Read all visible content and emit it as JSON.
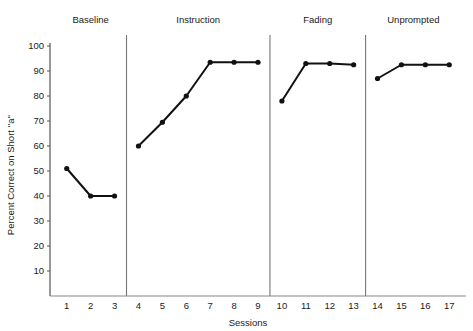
{
  "chart_data": {
    "type": "line",
    "title": "",
    "xlabel": "Sessions",
    "ylabel": "Percent Correct on Short ''a''",
    "xlim": [
      0.3,
      17.7
    ],
    "ylim": [
      0,
      100
    ],
    "yticks": [
      10,
      20,
      30,
      40,
      50,
      60,
      70,
      80,
      90,
      100
    ],
    "xticks": [
      1,
      2,
      3,
      4,
      5,
      6,
      7,
      8,
      9,
      10,
      11,
      12,
      13,
      14,
      15,
      16,
      17
    ],
    "grid": false,
    "legend": "none",
    "line_color": "#111111",
    "marker": "circle",
    "phases": [
      {
        "name": "Baseline",
        "sessions": [
          1,
          2,
          3
        ],
        "values": [
          51,
          40,
          40
        ]
      },
      {
        "name": "Instruction",
        "sessions": [
          4,
          5,
          6,
          7,
          8,
          9
        ],
        "values": [
          60,
          69.5,
          80,
          93.5,
          93.5,
          93.5
        ]
      },
      {
        "name": "Fading",
        "sessions": [
          10,
          11,
          12,
          13
        ],
        "values": [
          78,
          93,
          93,
          92.5
        ]
      },
      {
        "name": "Unprompted",
        "sessions": [
          14,
          15,
          16,
          17
        ],
        "values": [
          87,
          92.5,
          92.5,
          92.5
        ]
      }
    ],
    "phase_dividers": [
      3.5,
      9.5,
      13.5
    ]
  },
  "axis": {
    "y_title": "Percent Correct on Short ''a''",
    "x_title": "Sessions",
    "y_tick_labels": [
      "100",
      "90",
      "80",
      "70",
      "60",
      "50",
      "40",
      "30",
      "20",
      "10"
    ],
    "x_tick_labels": [
      "1",
      "2",
      "3",
      "4",
      "5",
      "6",
      "7",
      "8",
      "9",
      "10",
      "11",
      "12",
      "13",
      "14",
      "15",
      "16",
      "17"
    ]
  },
  "phase_headers": [
    "Baseline",
    "Instruction",
    "Fading",
    "Unprompted"
  ]
}
